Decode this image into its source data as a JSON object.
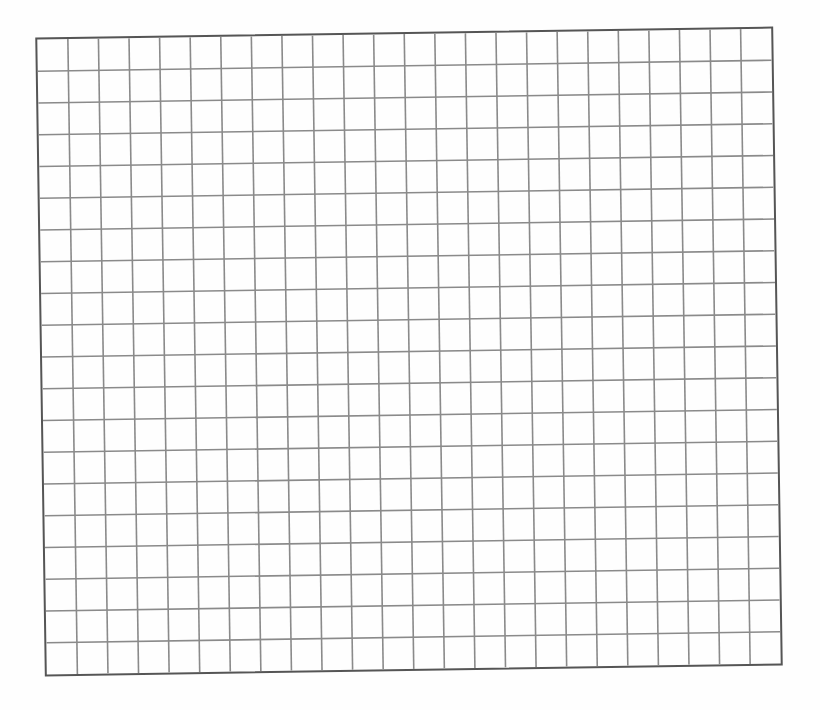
{
  "document": {
    "type": "blank graph paper",
    "grid": {
      "columns": 24,
      "rows": 20,
      "line_color": "#8a8a8a",
      "border_color": "#555555",
      "background_color": "#fefefe",
      "rotation_deg": -0.86
    }
  }
}
